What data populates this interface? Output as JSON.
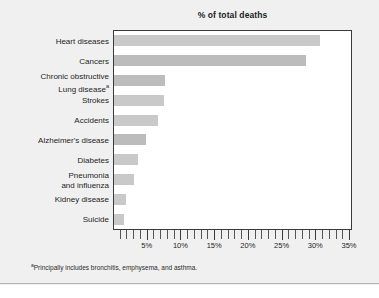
{
  "chart_data": {
    "type": "bar",
    "orientation": "horizontal",
    "title": "% of total deaths",
    "xlabel": "",
    "ylabel": "",
    "xlim": [
      0,
      35
    ],
    "xtick_labels": [
      "5%",
      "10%",
      "15%",
      "20%",
      "25%",
      "30%",
      "35%"
    ],
    "xtick_values": [
      5,
      10,
      15,
      20,
      25,
      30,
      35
    ],
    "minor_tick_interval": 1,
    "grid": false,
    "legend": false,
    "categories": [
      "Heart diseases",
      "Cancers",
      "Chronic obstructive Lung disease",
      "Strokes",
      "Accidents",
      "Alzheimer's disease",
      "Diabetes",
      "Pneumonia and influenza",
      "Kidney disease",
      "Suicide"
    ],
    "values": [
      30.5,
      28.5,
      7.5,
      7.4,
      6.5,
      4.8,
      3.5,
      3.0,
      1.8,
      1.5
    ],
    "footnote": "Principally includes bronchitis, emphysema, and asthma."
  },
  "labels": {
    "heart_diseases": "Heart diseases",
    "cancers": "Cancers",
    "copd_line1": "Chronic obstructive",
    "copd_line2": "Lung disease",
    "strokes": "Strokes",
    "accidents": "Accidents",
    "alzheimers": "Alzheimer's disease",
    "diabetes": "Diabetes",
    "pneumonia_line1": "Pneumonia",
    "pneumonia_line2": "and influenza",
    "kidney_disease": "Kidney disease",
    "suicide": "Suicide"
  },
  "footnote": {
    "marker": "a",
    "text": "Principally includes bronchitis, emphysema, and asthma."
  },
  "colors": {
    "figure_background": "#f0f0f0",
    "plot_background": "#ffffff",
    "plot_border": "#3a3a3a",
    "bar_fill": "#c9c9c9",
    "bar_fill_dark": "#bcbcbc",
    "text": "#1e1e1e"
  }
}
